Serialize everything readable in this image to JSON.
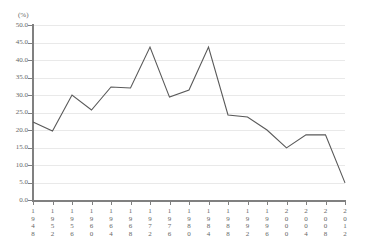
{
  "chart_data": {
    "type": "line",
    "title": "",
    "subtitle": "",
    "xlabel": "",
    "ylabel": "(%)",
    "unit": "(%)",
    "grid": true,
    "legend": "none",
    "xlim": [
      1948,
      2012
    ],
    "ylim": [
      0.0,
      50.0
    ],
    "ytick_step": 5.0,
    "ytick_labels": [
      "50.0",
      "45.0",
      "40.0",
      "35.0",
      "30.0",
      "25.0",
      "20.0",
      "15.0",
      "10.0",
      "5.0",
      "0.0"
    ],
    "ytick_values": [
      50.0,
      45.0,
      40.0,
      35.0,
      30.0,
      25.0,
      20.0,
      15.0,
      10.0,
      5.0,
      0.0
    ],
    "categories": [
      1948,
      1952,
      1956,
      1960,
      1964,
      1968,
      1972,
      1976,
      1980,
      1984,
      1988,
      1992,
      1996,
      2000,
      2004,
      2008,
      2012
    ],
    "xtick_labels": [
      "1948",
      "1952",
      "1956",
      "1960",
      "1964",
      "1968",
      "1972",
      "1976",
      "1980",
      "1984",
      "1988",
      "1992",
      "1996",
      "2000",
      "2004",
      "2008",
      "2012"
    ],
    "values": [
      22.3,
      19.7,
      30.0,
      25.7,
      32.3,
      32.0,
      43.7,
      29.4,
      31.4,
      43.7,
      24.3,
      23.7,
      20.0,
      14.9,
      18.6,
      18.6,
      4.9
    ],
    "series": [
      {
        "name": "",
        "color": "#595959",
        "values": [
          22.3,
          19.7,
          30.0,
          25.7,
          32.3,
          32.0,
          43.7,
          29.4,
          31.4,
          43.7,
          24.3,
          23.7,
          20.0,
          14.9,
          18.6,
          18.6,
          4.9
        ]
      }
    ],
    "colors": {
      "line": "#595959",
      "axis": "#808080",
      "grid": "#e9e9e9",
      "text": "#666666",
      "background": "#ffffff"
    }
  }
}
